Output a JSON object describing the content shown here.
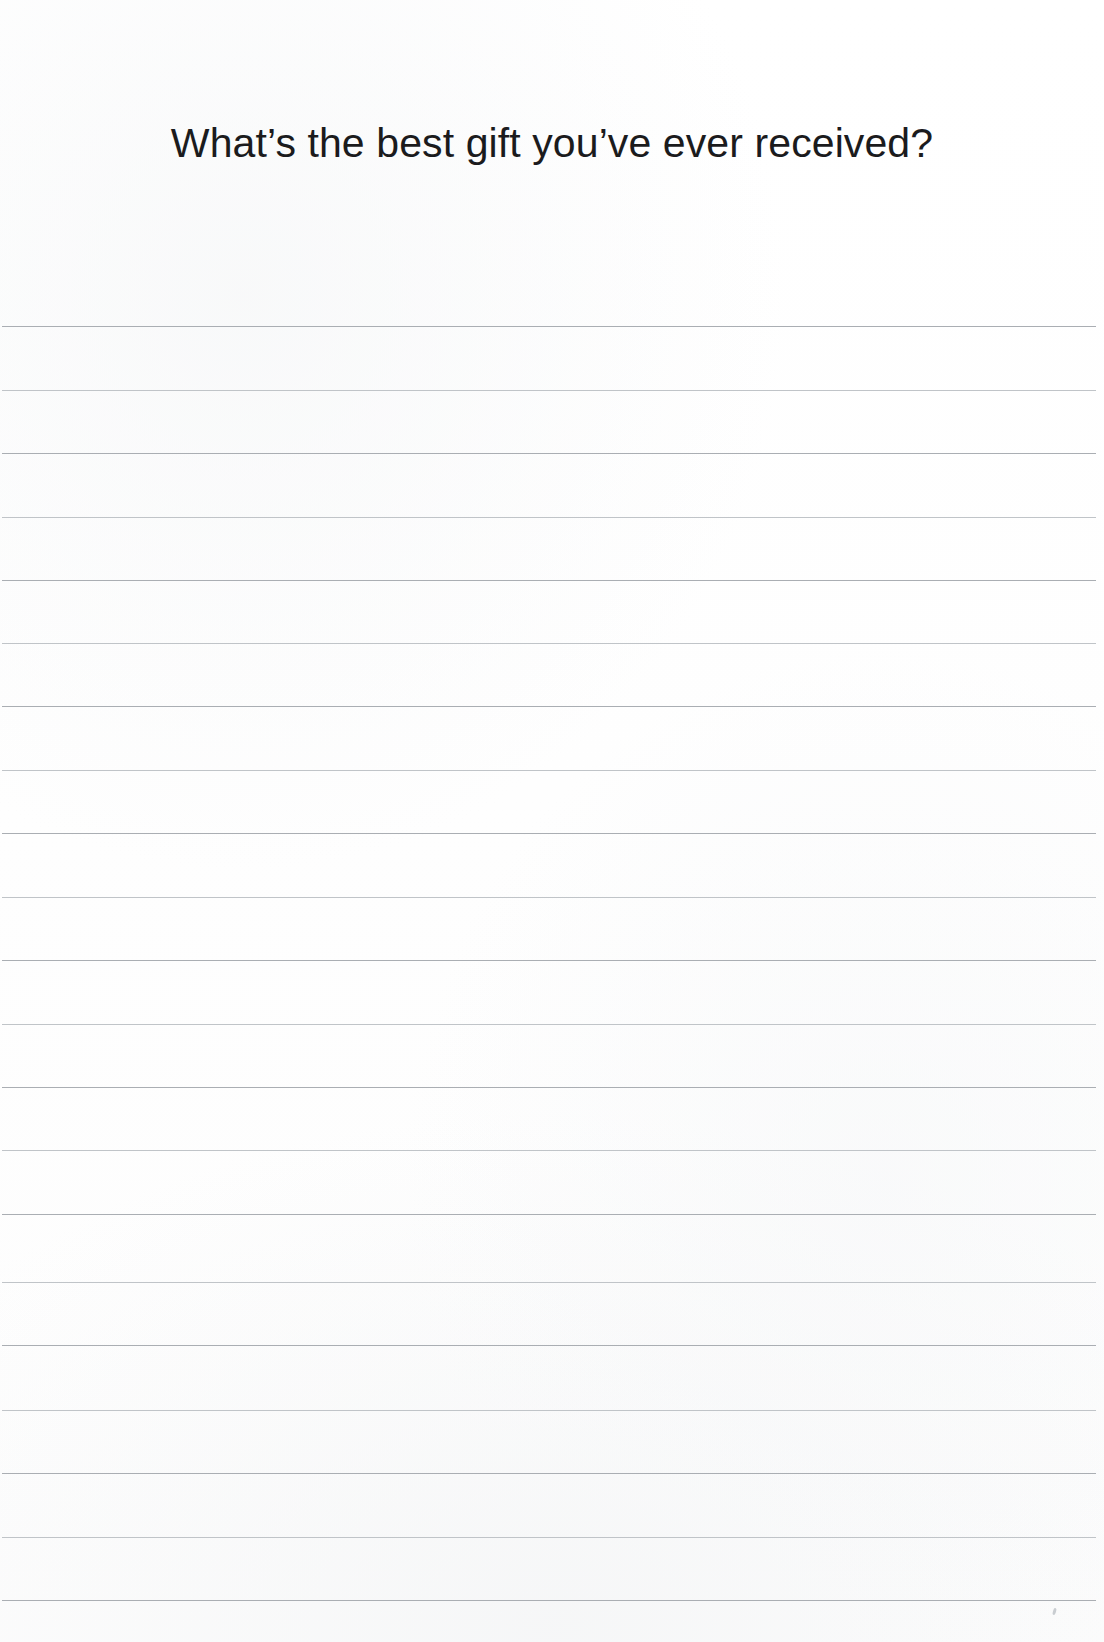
{
  "page": {
    "kind": "journal-prompt-page",
    "width": 1104,
    "height": 1642,
    "background_color": "#ffffff"
  },
  "prompt": {
    "title": "What’s the best gift you’ve ever received?",
    "text_color": "#1b1b1d",
    "font_size_px": 41,
    "align": "center",
    "top_px": 117
  },
  "writing_area": {
    "label": "Ruled writing area",
    "line_color": "#b4b8bc",
    "line_thickness_px": 1,
    "line_spacing_px": 63.7,
    "line_left_px": 2,
    "line_width_px": 1094,
    "line_count": 21,
    "first_line_y_px": 326,
    "last_line_y_px": 1600,
    "lines": [
      {
        "index": 1,
        "y": 326,
        "weight": "firm"
      },
      {
        "index": 2,
        "y": 390,
        "weight": "soft"
      },
      {
        "index": 3,
        "y": 453,
        "weight": "firm"
      },
      {
        "index": 4,
        "y": 517,
        "weight": "soft"
      },
      {
        "index": 5,
        "y": 580,
        "weight": "firm"
      },
      {
        "index": 6,
        "y": 643,
        "weight": "soft"
      },
      {
        "index": 7,
        "y": 706,
        "weight": "firm"
      },
      {
        "index": 8,
        "y": 770,
        "weight": "soft"
      },
      {
        "index": 9,
        "y": 833,
        "weight": "firm"
      },
      {
        "index": 10,
        "y": 897,
        "weight": "soft"
      },
      {
        "index": 11,
        "y": 960,
        "weight": "firm"
      },
      {
        "index": 12,
        "y": 1024,
        "weight": "soft"
      },
      {
        "index": 13,
        "y": 1087,
        "weight": "firm"
      },
      {
        "index": 14,
        "y": 1150,
        "weight": "soft"
      },
      {
        "index": 15,
        "y": 1214,
        "weight": "firm"
      },
      {
        "index": 16,
        "y": 1282,
        "weight": "soft"
      },
      {
        "index": 17,
        "y": 1345,
        "weight": "firm"
      },
      {
        "index": 18,
        "y": 1410,
        "weight": "soft"
      },
      {
        "index": 19,
        "y": 1473,
        "weight": "firm"
      },
      {
        "index": 20,
        "y": 1537,
        "weight": "soft"
      },
      {
        "index": 21,
        "y": 1600,
        "weight": "firm"
      }
    ]
  }
}
